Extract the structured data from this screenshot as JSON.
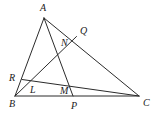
{
  "figure": {
    "background_color": "#ffffff",
    "stroke_color": "#2b2b2b",
    "label_color": "#1a1a1a",
    "stroke_width": 1.0,
    "width": 159,
    "height": 123
  },
  "points": {
    "A": {
      "label": "A",
      "x": 44.0,
      "y": 18.0,
      "label_x": 40.0,
      "label_y": 3.0,
      "kind": "vertex"
    },
    "B": {
      "label": "B",
      "x": 15.0,
      "y": 96.0,
      "label_x": 9.0,
      "label_y": 99.0,
      "kind": "vertex"
    },
    "C": {
      "label": "C",
      "x": 139.0,
      "y": 96.0,
      "label_x": 143.0,
      "label_y": 98.0,
      "kind": "vertex"
    },
    "P": {
      "label": "P",
      "x": 73.0,
      "y": 96.0,
      "label_x": 71.0,
      "label_y": 101.0,
      "kind": "point-on-side"
    },
    "Q": {
      "label": "Q",
      "x": 76.5,
      "y": 36.5,
      "label_x": 80.0,
      "label_y": 26.0,
      "kind": "point-on-side"
    },
    "R": {
      "label": "R",
      "x": 22.0,
      "y": 79.5,
      "label_x": 9.0,
      "label_y": 73.0,
      "kind": "point-on-side"
    },
    "L": {
      "label": "L",
      "x": 29.5,
      "y": 86.0,
      "label_x": 30.0,
      "label_y": 85.0,
      "kind": "intersection"
    },
    "M": {
      "label": "M",
      "x": 61.5,
      "y": 88.5,
      "label_x": 60.0,
      "label_y": 86.0,
      "kind": "intersection"
    },
    "N": {
      "label": "N",
      "x": 65.0,
      "y": 49.0,
      "label_x": 61.0,
      "label_y": 38.0,
      "kind": "intersection"
    }
  },
  "segments": [
    {
      "name": "side-AB",
      "from": "A",
      "to": "B"
    },
    {
      "name": "side-AC",
      "from": "A",
      "to": "C"
    },
    {
      "name": "side-BC",
      "from": "B",
      "to": "C"
    },
    {
      "name": "cevian-AP",
      "from": "A",
      "to": "P"
    },
    {
      "name": "cevian-BQ",
      "from": "B",
      "to": "Q"
    },
    {
      "name": "segment-RC",
      "from": "R",
      "to": "C"
    }
  ],
  "labels_order": [
    "A",
    "Q",
    "N",
    "R",
    "L",
    "M",
    "B",
    "P",
    "C"
  ]
}
